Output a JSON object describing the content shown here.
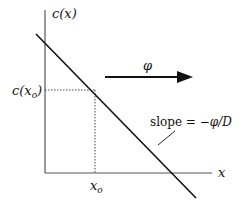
{
  "diagram": {
    "y_axis_label": "c(x)",
    "x_axis_label": "x",
    "point_y_label": "c(x",
    "point_y_subscript": "o",
    "point_y_close": ")",
    "point_x_label": "x",
    "point_x_subscript": "o",
    "flux_label": "φ",
    "slope_label_prefix": "slope = −",
    "slope_label_phi": "φ",
    "slope_label_suffix": "/D",
    "colors": {
      "line": "#111111",
      "dotted": "#333333"
    }
  }
}
